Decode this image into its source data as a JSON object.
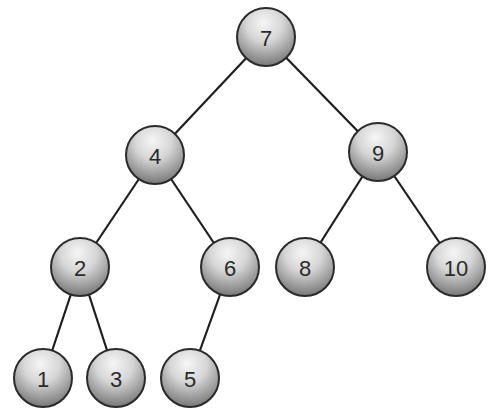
{
  "diagram": {
    "type": "binary-search-tree",
    "colors": {
      "background": "#ffffff",
      "edge": "#1e1e1e",
      "node_outline": "#2a2a2a",
      "node_fill_light": "#f4f4f4",
      "node_fill_dark": "#8a8a8a",
      "label": "#2b2b2b"
    },
    "node_radius": 29,
    "nodes": [
      {
        "id": "n7",
        "label": "7",
        "x": 266,
        "y": 37
      },
      {
        "id": "n4",
        "label": "4",
        "x": 155,
        "y": 155
      },
      {
        "id": "n9",
        "label": "9",
        "x": 378,
        "y": 152
      },
      {
        "id": "n2",
        "label": "2",
        "x": 80,
        "y": 267
      },
      {
        "id": "n6",
        "label": "6",
        "x": 230,
        "y": 267
      },
      {
        "id": "n8",
        "label": "8",
        "x": 305,
        "y": 267
      },
      {
        "id": "n10",
        "label": "10",
        "x": 456,
        "y": 267
      },
      {
        "id": "n1",
        "label": "1",
        "x": 43,
        "y": 378
      },
      {
        "id": "n3",
        "label": "3",
        "x": 116,
        "y": 378
      },
      {
        "id": "n5",
        "label": "5",
        "x": 190,
        "y": 378
      }
    ],
    "edges": [
      {
        "from": "n7",
        "to": "n4"
      },
      {
        "from": "n7",
        "to": "n9"
      },
      {
        "from": "n4",
        "to": "n2"
      },
      {
        "from": "n4",
        "to": "n6"
      },
      {
        "from": "n9",
        "to": "n8"
      },
      {
        "from": "n9",
        "to": "n10"
      },
      {
        "from": "n2",
        "to": "n1"
      },
      {
        "from": "n2",
        "to": "n3"
      },
      {
        "from": "n6",
        "to": "n5"
      }
    ]
  }
}
